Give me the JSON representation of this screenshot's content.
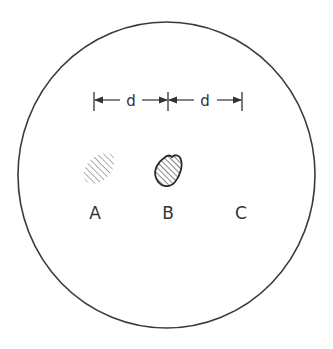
{
  "diagram": {
    "dimension_labels": [
      "d",
      "d"
    ],
    "spot_labels": [
      "A",
      "B",
      "C"
    ],
    "spots": [
      {
        "label": "A",
        "appearance": "faint hatched, no outline"
      },
      {
        "label": "B",
        "appearance": "hatched, outlined"
      },
      {
        "label": "C",
        "appearance": "empty"
      }
    ],
    "colors": {
      "stroke": "#333333",
      "faint": "#8a8a8a",
      "background": "#ffffff"
    }
  }
}
